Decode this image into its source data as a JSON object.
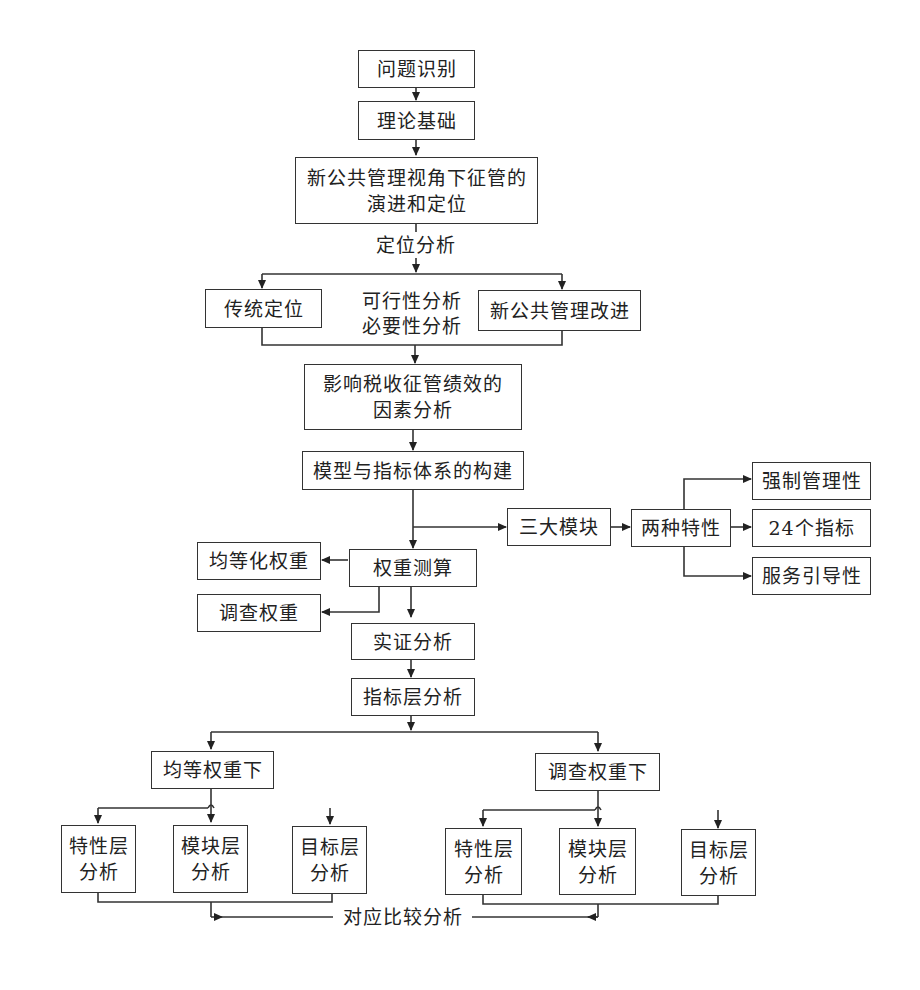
{
  "diagram": {
    "type": "flowchart",
    "nodes": {
      "problem": "问题识别",
      "theory": "理论基础",
      "evolution_line1": "新公共管理视角下征管的",
      "evolution_line2": "演进和定位",
      "positioning_analysis": "定位分析",
      "traditional": "传统定位",
      "feasibility": "可行性分析",
      "necessity": "必要性分析",
      "npm_improve": "新公共管理改进",
      "factors_line1": "影响税收征管绩效的",
      "factors_line2": "因素分析",
      "model": "模型与指标体系的构建",
      "three_modules": "三大模块",
      "two_traits": "两种特性",
      "coercive": "强制管理性",
      "indicators": "24个指标",
      "service": "服务引导性",
      "weighting": "权重测算",
      "equal_weight": "均等化权重",
      "survey_weight": "调查权重",
      "empirical": "实证分析",
      "indicator_layer": "指标层分析",
      "under_equal": "均等权重下",
      "under_survey": "调查权重下",
      "trait_layer_l1": "特性层",
      "module_layer_l1": "模块层",
      "goal_layer_l1": "目标层",
      "analysis": "分析",
      "comparison": "对应比较分析"
    },
    "edges": [
      [
        "问题识别",
        "理论基础"
      ],
      [
        "理论基础",
        "新公共管理视角下征管的演进和定位"
      ],
      [
        "新公共管理视角下征管的演进和定位",
        "传统定位"
      ],
      [
        "新公共管理视角下征管的演进和定位",
        "新公共管理改进"
      ],
      [
        "传统定位",
        "影响税收征管绩效的因素分析"
      ],
      [
        "新公共管理改进",
        "影响税收征管绩效的因素分析"
      ],
      [
        "影响税收征管绩效的因素分析",
        "模型与指标体系的构建"
      ],
      [
        "模型与指标体系的构建",
        "三大模块"
      ],
      [
        "三大模块",
        "两种特性"
      ],
      [
        "两种特性",
        "强制管理性"
      ],
      [
        "两种特性",
        "24个指标"
      ],
      [
        "两种特性",
        "服务引导性"
      ],
      [
        "模型与指标体系的构建",
        "权重测算"
      ],
      [
        "权重测算",
        "均等化权重"
      ],
      [
        "权重测算",
        "调查权重"
      ],
      [
        "权重测算",
        "实证分析"
      ],
      [
        "实证分析",
        "指标层分析"
      ],
      [
        "指标层分析",
        "均等权重下"
      ],
      [
        "指标层分析",
        "调查权重下"
      ],
      [
        "均等权重下",
        "特性层分析"
      ],
      [
        "均等权重下",
        "模块层分析"
      ],
      [
        "均等权重下",
        "目标层分析"
      ],
      [
        "调查权重下",
        "特性层分析"
      ],
      [
        "调查权重下",
        "模块层分析"
      ],
      [
        "调查权重下",
        "目标层分析"
      ],
      [
        "均等权重下分析组",
        "对应比较分析"
      ],
      [
        "调查权重下分析组",
        "对应比较分析"
      ]
    ]
  }
}
